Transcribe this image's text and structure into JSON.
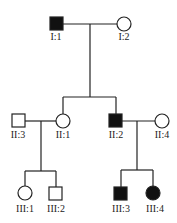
{
  "diagram": {
    "type": "pedigree",
    "legend_colors": {
      "affected": "#111111",
      "unaffected": "#ffffff",
      "line": "#222222"
    },
    "individuals": [
      {
        "id": "I:1",
        "label": "I:1",
        "sex": "male",
        "affected": true
      },
      {
        "id": "I:2",
        "label": "I:2",
        "sex": "female",
        "affected": false
      },
      {
        "id": "II:1",
        "label": "II:1",
        "sex": "female",
        "affected": false
      },
      {
        "id": "II:2",
        "label": "II:2",
        "sex": "male",
        "affected": true
      },
      {
        "id": "II:3",
        "label": "II:3",
        "sex": "male",
        "affected": false
      },
      {
        "id": "II:4",
        "label": "II:4",
        "sex": "female",
        "affected": false
      },
      {
        "id": "III:1",
        "label": "III:1",
        "sex": "female",
        "affected": false
      },
      {
        "id": "III:2",
        "label": "III:2",
        "sex": "male",
        "affected": false
      },
      {
        "id": "III:3",
        "label": "III:3",
        "sex": "male",
        "affected": true
      },
      {
        "id": "III:4",
        "label": "III:4",
        "sex": "female",
        "affected": true
      }
    ],
    "matings": [
      {
        "partners": [
          "I:1",
          "I:2"
        ],
        "children": [
          "II:1",
          "II:2"
        ]
      },
      {
        "partners": [
          "II:3",
          "II:1"
        ],
        "children": [
          "III:1",
          "III:2"
        ]
      },
      {
        "partners": [
          "II:2",
          "II:4"
        ],
        "children": [
          "III:3",
          "III:4"
        ]
      }
    ]
  }
}
